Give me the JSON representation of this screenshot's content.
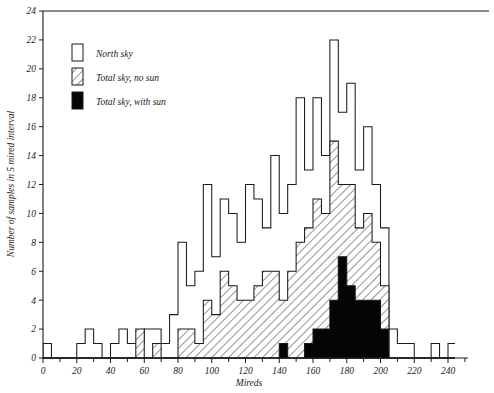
{
  "chart_data": {
    "type": "bar",
    "title": "",
    "subtitle": "",
    "xlabel": "Mireds",
    "ylabel": "Number of samples in 5 mired interval",
    "xlim": [
      0,
      250
    ],
    "ylim": [
      0,
      24
    ],
    "bin_width": 5,
    "grid": false,
    "legend_position": "upper-left",
    "x_ticks": [
      0,
      10,
      20,
      30,
      40,
      50,
      60,
      70,
      80,
      90,
      100,
      110,
      120,
      130,
      140,
      150,
      160,
      170,
      180,
      190,
      200,
      210,
      220,
      230,
      240,
      250
    ],
    "x_tick_labels": [
      "0",
      "",
      "20",
      "",
      "40",
      "",
      "60",
      "",
      "80",
      "",
      "100",
      "",
      "120",
      "",
      "140",
      "",
      "160",
      "",
      "180",
      "",
      "200",
      "",
      "220",
      "",
      "240",
      ""
    ],
    "y_ticks": [
      0,
      2,
      4,
      6,
      8,
      10,
      12,
      14,
      16,
      18,
      20,
      22,
      24
    ],
    "y_tick_labels": [
      "0",
      "2",
      "4",
      "6",
      "8",
      "10",
      "12",
      "14",
      "16",
      "18",
      "20",
      "22",
      "24"
    ],
    "categories": [
      0,
      5,
      10,
      15,
      20,
      25,
      30,
      35,
      40,
      45,
      50,
      55,
      60,
      65,
      70,
      75,
      80,
      85,
      90,
      95,
      100,
      105,
      110,
      115,
      120,
      125,
      130,
      135,
      140,
      145,
      150,
      155,
      160,
      165,
      170,
      175,
      180,
      185,
      190,
      195,
      200,
      205,
      210,
      215,
      220,
      225,
      230,
      235,
      240,
      245
    ],
    "series": [
      {
        "name": "North sky",
        "key": "north",
        "pattern": "open",
        "color": "#ffffff",
        "values": [
          1,
          0,
          0,
          0,
          1,
          2,
          1,
          0,
          1,
          2,
          1,
          1,
          2,
          2,
          1,
          3,
          8,
          5,
          6,
          12,
          7,
          11,
          10,
          8,
          12,
          11,
          9,
          14,
          10,
          12,
          18,
          13,
          18,
          14,
          22,
          17,
          19,
          13,
          16,
          12,
          9,
          2,
          1,
          1,
          0,
          0,
          1,
          0,
          1,
          0
        ]
      },
      {
        "name": "Total sky, no sun",
        "key": "nosun",
        "pattern": "hatch",
        "color": "#ffffff",
        "values": [
          0,
          0,
          0,
          0,
          0,
          0,
          0,
          0,
          0,
          0,
          0,
          2,
          0,
          1,
          0,
          0,
          2,
          2,
          1,
          4,
          3,
          6,
          5,
          4,
          4,
          5,
          6,
          6,
          4,
          6,
          8,
          9,
          11,
          10,
          15,
          12,
          12,
          9,
          10,
          8,
          5,
          0,
          0,
          0,
          0,
          0,
          0,
          0,
          0,
          0
        ]
      },
      {
        "name": "Total sky, with sun",
        "key": "sun",
        "pattern": "solid",
        "color": "#050505",
        "values": [
          0,
          0,
          0,
          0,
          0,
          0,
          0,
          0,
          0,
          0,
          0,
          0,
          0,
          0,
          0,
          0,
          0,
          0,
          0,
          0,
          0,
          0,
          0,
          0,
          0,
          0,
          0,
          0,
          1,
          0,
          0,
          1,
          2,
          2,
          4,
          7,
          5,
          4,
          4,
          4,
          2,
          0,
          0,
          0,
          0,
          0,
          0,
          0,
          0,
          0
        ]
      }
    ],
    "legend": [
      {
        "label": "North sky",
        "swatch": "open"
      },
      {
        "label": "Total sky, no sun",
        "swatch": "hatch"
      },
      {
        "label": "Total sky, with sun",
        "swatch": "solid"
      }
    ]
  }
}
